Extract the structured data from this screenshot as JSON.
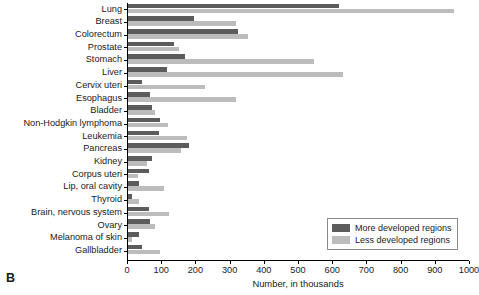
{
  "panel": {
    "letter": "B"
  },
  "chart_data": {
    "type": "bar",
    "orientation": "horizontal",
    "title": "",
    "xlabel": "Number, in thousands",
    "ylabel": "",
    "xlim": [
      0,
      1000
    ],
    "xticks": [
      0,
      100,
      200,
      300,
      400,
      500,
      600,
      700,
      800,
      900,
      1000
    ],
    "grid": false,
    "legend_position": "bottom-right",
    "categories": [
      "Lung",
      "Breast",
      "Colorectum",
      "Prostate",
      "Stomach",
      "Liver",
      "Cervix uteri",
      "Esophagus",
      "Bladder",
      "Non-Hodgkin lymphoma",
      "Leukemia",
      "Pancreas",
      "Kidney",
      "Corpus uteri",
      "Lip, oral cavity",
      "Thyroid",
      "Brain, nervous system",
      "Ovary",
      "Melanoma of skin",
      "Gallbladder"
    ],
    "series": [
      {
        "name": "More developed regions",
        "color": "#5c5c5c",
        "values": [
          616,
          194,
          323,
          135,
          167,
          114,
          41,
          65,
          70,
          94,
          91,
          179,
          70,
          62,
          32,
          12,
          62,
          65,
          32,
          41
        ]
      },
      {
        "name": "Less developed regions",
        "color": "#bcbcbc",
        "values": [
          953,
          317,
          352,
          150,
          543,
          630,
          226,
          317,
          79,
          117,
          173,
          155,
          56,
          29,
          106,
          32,
          120,
          79,
          12,
          94
        ]
      }
    ]
  },
  "legend": {
    "items": [
      {
        "label": "More developed regions",
        "swatch": "more"
      },
      {
        "label": "Less developed regions",
        "swatch": "less"
      }
    ]
  }
}
